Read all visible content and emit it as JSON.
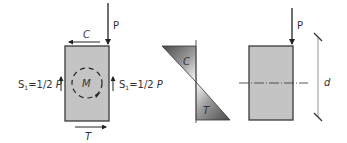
{
  "diagram": {
    "left_section": {
      "load_label": "P",
      "compression_label": "C",
      "tension_label": "T",
      "moment_label": "M",
      "shear_left": {
        "base": "S",
        "sub": "1",
        "rest": "=1/2 ",
        "var": "P"
      },
      "shear_right": {
        "base": "S",
        "sub": "1",
        "rest": "=1/2 ",
        "var": "P"
      }
    },
    "stress_diagram": {
      "compression_label": "C",
      "tension_label": "T"
    },
    "right_section": {
      "load_label": "P",
      "depth_label": "d"
    },
    "colors": {
      "section_fill": "#c4c4c4",
      "outline": "#3a3a3a",
      "stress_dark": "#555555",
      "stress_light": "#ffffff",
      "dim_line": "#8a8a8a"
    }
  }
}
